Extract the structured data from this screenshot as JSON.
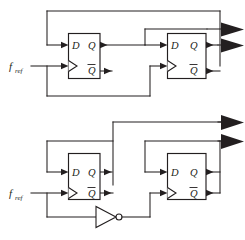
{
  "figure": {
    "background_color": "#ffffff",
    "line_color": "#231f20",
    "width": 245,
    "height": 240
  },
  "circuits": [
    {
      "id": "top-circuit",
      "name": "divide-by-four-chain",
      "input": {
        "label_main": "f",
        "label_sub": "ref",
        "name": "f_ref"
      },
      "flipflops": [
        {
          "id": "ff-top-left",
          "name": "flip-flop-1",
          "pins": {
            "d": "D",
            "clk": "",
            "q": "Q",
            "qbar": "Q"
          },
          "qbar_overline": true
        },
        {
          "id": "ff-top-right",
          "name": "flip-flop-2",
          "pins": {
            "d": "D",
            "clk": "",
            "q": "Q",
            "qbar": "Q"
          },
          "qbar_overline": true
        }
      ],
      "outputs": [
        {
          "id": "top-out-1",
          "name": "output-arrow-top-1"
        },
        {
          "id": "top-out-2",
          "name": "output-arrow-top-2"
        }
      ],
      "gates": []
    },
    {
      "id": "bottom-circuit",
      "name": "divide-by-three-chain",
      "input": {
        "label_main": "f",
        "label_sub": "ref",
        "name": "f_ref"
      },
      "flipflops": [
        {
          "id": "ff-bottom-left",
          "name": "flip-flop-3",
          "pins": {
            "d": "D",
            "clk": "",
            "q": "Q",
            "qbar": "Q"
          },
          "qbar_overline": true
        },
        {
          "id": "ff-bottom-right",
          "name": "flip-flop-4",
          "pins": {
            "d": "D",
            "clk": "",
            "q": "Q",
            "qbar": "Q"
          },
          "qbar_overline": true
        }
      ],
      "outputs": [
        {
          "id": "bottom-out-1",
          "name": "output-arrow-bottom-1"
        },
        {
          "id": "bottom-out-2",
          "name": "output-arrow-bottom-2"
        }
      ],
      "gates": [
        {
          "id": "inverter-1",
          "name": "inverter-gate",
          "type": "NOT"
        }
      ]
    }
  ]
}
